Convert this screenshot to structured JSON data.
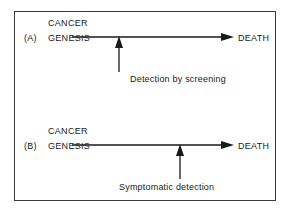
{
  "figure": {
    "type": "natural-history-timeline-diagram",
    "border_color": "#3a3a3a",
    "line_color": "#1a1a1a",
    "background": "#ffffff"
  },
  "panels": [
    {
      "id": "A",
      "label": "(A)",
      "origin_line1": "CANCER",
      "origin_line2": "GENESIS",
      "endpoint": "DEATH",
      "detection_caption": "Detection by screening",
      "detection_position_x": 119,
      "timeline_start_x": 72,
      "timeline_end_x": 222,
      "timeline_y": 37
    },
    {
      "id": "B",
      "label": "(B)",
      "origin_line1": "CANCER",
      "origin_line2": "GENESIS",
      "endpoint": "DEATH",
      "detection_caption": "Symptomatic detection",
      "detection_position_x": 180,
      "timeline_start_x": 72,
      "timeline_end_x": 222,
      "timeline_y": 145
    }
  ]
}
